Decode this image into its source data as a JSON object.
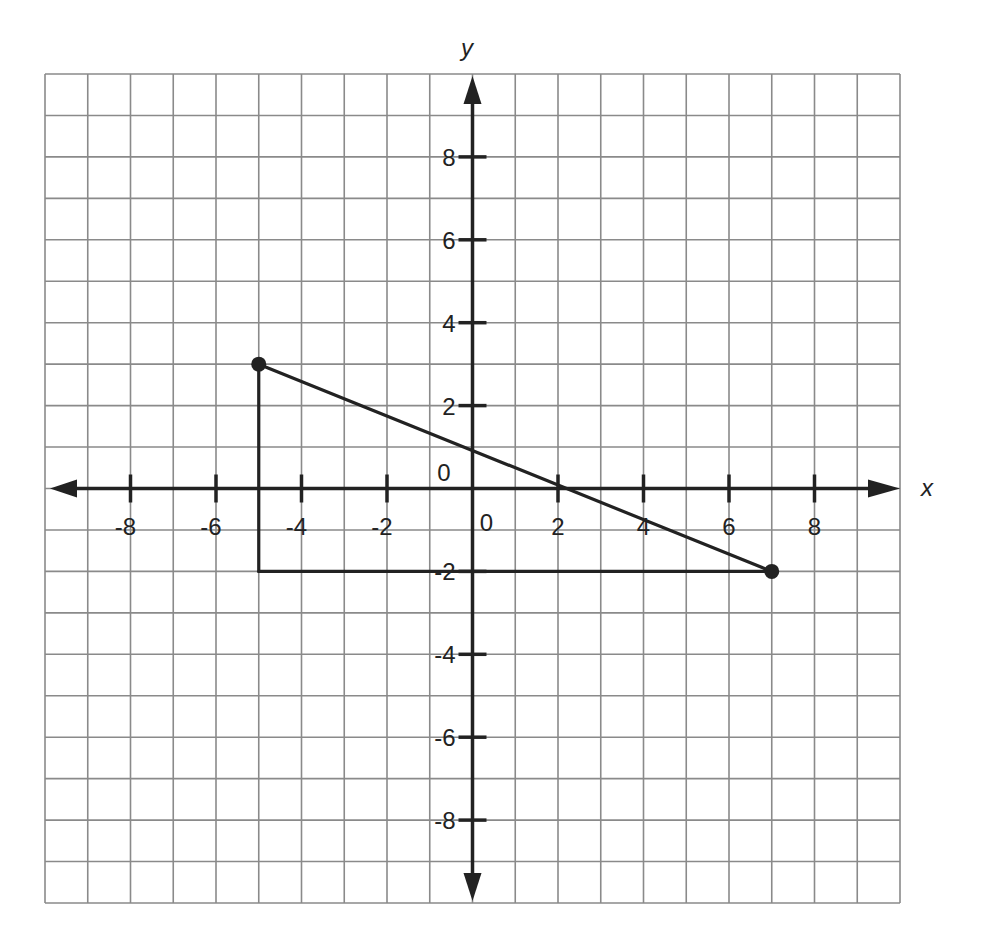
{
  "chart_data": {
    "type": "line",
    "title": "",
    "xlabel": "x",
    "ylabel": "y",
    "xlim": [
      -10,
      10
    ],
    "ylim": [
      -10,
      10
    ],
    "grid": true,
    "grid_step": 1,
    "x_ticks": [
      -8,
      -6,
      -4,
      -2,
      0,
      2,
      4,
      6,
      8
    ],
    "y_ticks": [
      -8,
      -6,
      -4,
      -2,
      0,
      2,
      4,
      6,
      8
    ],
    "x_tick_labels": [
      "-8",
      "-6",
      "-4",
      "-2",
      "0",
      "2",
      "4",
      "6",
      "8"
    ],
    "y_tick_labels": [
      "-8",
      "-6",
      "-4",
      "-2",
      "0",
      "2",
      "4",
      "6",
      "8"
    ],
    "origin_labels": [
      "0",
      "0"
    ],
    "points": [
      {
        "x": -5,
        "y": 3,
        "marked": true
      },
      {
        "x": 7,
        "y": -2,
        "marked": true
      }
    ],
    "segments": [
      {
        "from": [
          -5,
          3
        ],
        "to": [
          7,
          -2
        ],
        "name": "hypotenuse"
      },
      {
        "from": [
          -5,
          3
        ],
        "to": [
          -5,
          -2
        ],
        "name": "vertical-leg"
      },
      {
        "from": [
          -5,
          -2
        ],
        "to": [
          7,
          -2
        ],
        "name": "horizontal-leg"
      }
    ],
    "legend": null
  },
  "colors": {
    "grid": "#8a8a8a",
    "axis": "#222222",
    "shape": "#222222",
    "background": "#ffffff"
  }
}
